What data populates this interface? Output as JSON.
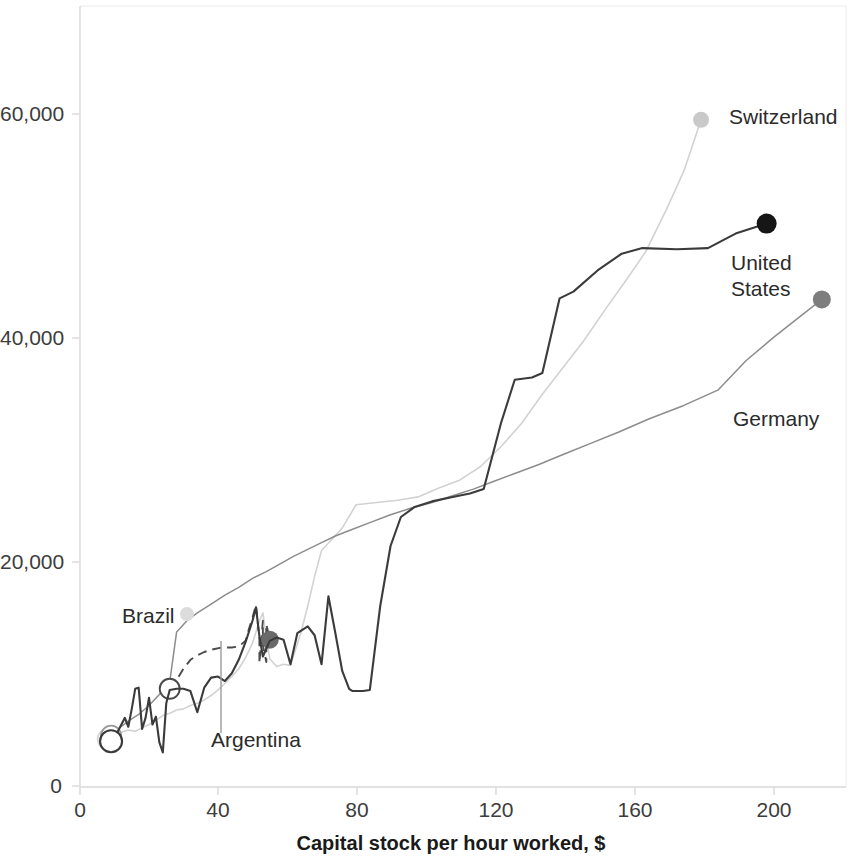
{
  "chart_data": {
    "type": "line",
    "title": "",
    "subtitle": "",
    "xlabel": "Capital stock per hour worked, $",
    "ylabel": "",
    "xlim": [
      0,
      222
    ],
    "ylim": [
      0,
      70000
    ],
    "xticks": [
      0,
      40,
      80,
      120,
      160,
      200
    ],
    "xtick_labels": [
      "0",
      "40",
      "80",
      "120",
      "160",
      "200"
    ],
    "yticks": [
      0,
      20000,
      40000,
      60000
    ],
    "ytick_labels": [
      "0",
      "20,000",
      "40,000",
      "60,000"
    ],
    "grid": false,
    "legend_position": "inline-end-labels",
    "annotations": [
      {
        "text": "Switzerland",
        "x": 188,
        "y": 59800
      },
      {
        "text": "United\nStates",
        "x": 194,
        "y": 45500
      },
      {
        "text": "Germany",
        "x": 190,
        "y": 33800
      },
      {
        "text": "Brazil",
        "x": 16,
        "y": 15200
      },
      {
        "text": "Argentina",
        "x": 39,
        "y": 4200
      }
    ],
    "series": [
      {
        "name": "Switzerland",
        "color": "#d2d2d2",
        "style": "solid",
        "marker_start": "open-circle",
        "marker_end": "filled-circle",
        "points": [
          [
            8,
            4300
          ],
          [
            10,
            4500
          ],
          [
            12,
            4900
          ],
          [
            14,
            5100
          ],
          [
            16,
            5000
          ],
          [
            18,
            5300
          ],
          [
            20,
            5600
          ],
          [
            22,
            6000
          ],
          [
            24,
            6400
          ],
          [
            26,
            6600
          ],
          [
            28,
            6900
          ],
          [
            30,
            7000
          ],
          [
            32,
            7300
          ],
          [
            34,
            7500
          ],
          [
            36,
            7800
          ],
          [
            38,
            8200
          ],
          [
            40,
            8700
          ],
          [
            42,
            9300
          ],
          [
            44,
            9900
          ],
          [
            46,
            10600
          ],
          [
            48,
            11600
          ],
          [
            50,
            12900
          ],
          [
            52,
            14900
          ],
          [
            53,
            15600
          ],
          [
            54,
            13400
          ],
          [
            55,
            11500
          ],
          [
            57,
            10800
          ],
          [
            59,
            11000
          ],
          [
            61,
            10900
          ],
          [
            64,
            13800
          ],
          [
            66,
            16200
          ],
          [
            68,
            18900
          ],
          [
            70,
            21200
          ],
          [
            73,
            22200
          ],
          [
            76,
            23200
          ],
          [
            80,
            25300
          ],
          [
            86,
            25500
          ],
          [
            92,
            25700
          ],
          [
            98,
            26000
          ],
          [
            104,
            26800
          ],
          [
            110,
            27500
          ],
          [
            116,
            28700
          ],
          [
            122,
            30500
          ],
          [
            128,
            32600
          ],
          [
            134,
            35200
          ],
          [
            140,
            37600
          ],
          [
            146,
            40000
          ],
          [
            152,
            42700
          ],
          [
            158,
            45300
          ],
          [
            164,
            48000
          ],
          [
            170,
            51800
          ],
          [
            175,
            55200
          ],
          [
            180,
            59800
          ]
        ]
      },
      {
        "name": "United States",
        "color": "#3b3b3b",
        "style": "solid",
        "marker_start": "open-circle",
        "marker_end": "filled-circle",
        "points": [
          [
            9,
            4100
          ],
          [
            11,
            5000
          ],
          [
            13,
            6200
          ],
          [
            14,
            5400
          ],
          [
            15,
            7000
          ],
          [
            16,
            8800
          ],
          [
            17,
            8900
          ],
          [
            18,
            5200
          ],
          [
            19,
            6200
          ],
          [
            20,
            8000
          ],
          [
            21,
            5600
          ],
          [
            22,
            6300
          ],
          [
            23,
            4000
          ],
          [
            24,
            3100
          ],
          [
            25,
            7500
          ],
          [
            26,
            8700
          ],
          [
            28,
            8800
          ],
          [
            30,
            8800
          ],
          [
            32,
            8600
          ],
          [
            34,
            6700
          ],
          [
            36,
            8900
          ],
          [
            38,
            9800
          ],
          [
            40,
            9900
          ],
          [
            42,
            9500
          ],
          [
            44,
            10200
          ],
          [
            46,
            11400
          ],
          [
            48,
            13000
          ],
          [
            50,
            14900
          ],
          [
            51,
            16100
          ],
          [
            52,
            13500
          ],
          [
            53,
            11700
          ],
          [
            55,
            13100
          ],
          [
            57,
            13400
          ],
          [
            59,
            13200
          ],
          [
            61,
            11000
          ],
          [
            63,
            13800
          ],
          [
            66,
            14400
          ],
          [
            68,
            13600
          ],
          [
            70,
            11000
          ],
          [
            72,
            17100
          ],
          [
            74,
            13800
          ],
          [
            76,
            10400
          ],
          [
            78,
            8800
          ],
          [
            79,
            8600
          ],
          [
            82,
            8600
          ],
          [
            84,
            8700
          ],
          [
            87,
            16200
          ],
          [
            90,
            21600
          ],
          [
            93,
            24200
          ],
          [
            97,
            25100
          ],
          [
            102,
            25600
          ],
          [
            108,
            26000
          ],
          [
            113,
            26300
          ],
          [
            117,
            26700
          ],
          [
            122,
            32600
          ],
          [
            126,
            36500
          ],
          [
            131,
            36700
          ],
          [
            134,
            37100
          ],
          [
            139,
            43800
          ],
          [
            143,
            44400
          ],
          [
            150,
            46300
          ],
          [
            157,
            47800
          ],
          [
            163,
            48300
          ],
          [
            173,
            48200
          ],
          [
            182,
            48300
          ],
          [
            190,
            49600
          ],
          [
            199,
            50500
          ]
        ]
      },
      {
        "name": "Germany",
        "color": "#8c8c8c",
        "style": "solid",
        "marker_start": "open-circle",
        "marker_end": "filled-circle",
        "points": [
          [
            9,
            4600
          ],
          [
            11,
            5200
          ],
          [
            14,
            5900
          ],
          [
            17,
            6500
          ],
          [
            20,
            7300
          ],
          [
            23,
            8300
          ],
          [
            26,
            9400
          ],
          [
            28,
            13900
          ],
          [
            31,
            14900
          ],
          [
            34,
            15600
          ],
          [
            38,
            16400
          ],
          [
            42,
            17200
          ],
          [
            46,
            17900
          ],
          [
            50,
            18700
          ],
          [
            54,
            19300
          ],
          [
            58,
            20000
          ],
          [
            62,
            20700
          ],
          [
            66,
            21300
          ],
          [
            70,
            21900
          ],
          [
            74,
            22500
          ],
          [
            79,
            23100
          ],
          [
            84,
            23700
          ],
          [
            90,
            24400
          ],
          [
            96,
            25000
          ],
          [
            102,
            25500
          ],
          [
            108,
            26100
          ],
          [
            114,
            26700
          ],
          [
            120,
            27400
          ],
          [
            126,
            28100
          ],
          [
            133,
            28900
          ],
          [
            140,
            29800
          ],
          [
            148,
            30800
          ],
          [
            156,
            31800
          ],
          [
            165,
            33000
          ],
          [
            175,
            34200
          ],
          [
            185,
            35600
          ],
          [
            193,
            38200
          ],
          [
            201,
            40300
          ],
          [
            208,
            42000
          ],
          [
            215,
            43700
          ]
        ]
      },
      {
        "name": "Brazil",
        "color": "#4a4a4a",
        "style": "dashed",
        "marker_start": "open-circle",
        "marker_end": "filled-circle",
        "points": [
          [
            26,
            8800
          ],
          [
            28,
            9600
          ],
          [
            30,
            10600
          ],
          [
            32,
            11400
          ],
          [
            34,
            11800
          ],
          [
            36,
            12100
          ],
          [
            38,
            12300
          ],
          [
            41,
            12500
          ],
          [
            44,
            12500
          ],
          [
            46,
            12600
          ],
          [
            48,
            13100
          ],
          [
            49,
            14200
          ],
          [
            50,
            15200
          ],
          [
            51,
            16300
          ],
          [
            52,
            13300
          ],
          [
            52,
            11100
          ],
          [
            53,
            14900
          ],
          [
            53,
            12700
          ],
          [
            54,
            11200
          ],
          [
            54,
            14600
          ],
          [
            55,
            13200
          ]
        ]
      }
    ]
  },
  "axis": {
    "x_title": "Capital stock per hour worked, $",
    "x_tick_labels": [
      "0",
      "40",
      "80",
      "120",
      "160",
      "200"
    ],
    "y_tick_labels": [
      "0",
      "20,000",
      "40,000",
      "60,000"
    ]
  },
  "labels": {
    "switzerland": "Switzerland",
    "united_states_line1": "United",
    "united_states_line2": "States",
    "germany": "Germany",
    "brazil": "Brazil",
    "argentina": "Argentina"
  },
  "colors": {
    "switzerland": "#d2d2d2",
    "united_states": "#3b3b3b",
    "germany": "#8c8c8c",
    "brazil": "#4a4a4a",
    "axis": "#d8d8d8",
    "text": "#2b2b2b",
    "background": "#ffffff"
  }
}
